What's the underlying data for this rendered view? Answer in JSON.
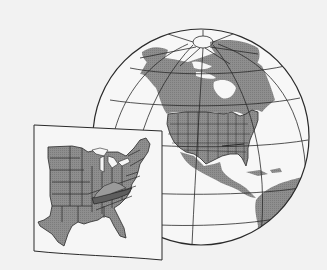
{
  "illustration": {
    "description": "Globe showing North America with an inset map of the eastern United States, Tennessee highlighted",
    "colors": {
      "background": "#f2f2f2",
      "ocean": "#f7f7f7",
      "land": "#8c8c8c",
      "land_dark": "#7a7a7a",
      "highlight": "#5e5e5e",
      "lines": "#2a2a2a",
      "inset_bg": "#f6f6f6"
    },
    "globe": {
      "cx": 201,
      "cy": 137,
      "r": 108
    },
    "inset": {
      "corners": [
        [
          34,
          125
        ],
        [
          162,
          131
        ],
        [
          162,
          260
        ],
        [
          34,
          251
        ]
      ]
    },
    "highlighted_state": "Tennessee"
  }
}
